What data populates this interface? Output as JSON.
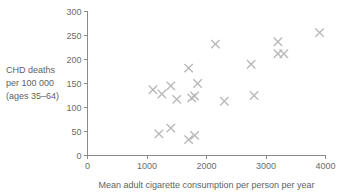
{
  "chart_data": {
    "type": "scatter",
    "title": "",
    "xlabel": "Mean adult cigarette consumption per person per year",
    "ylabel": "CHD deaths per 100 000 (ages 35–64)",
    "ylabel_lines": [
      "CHD deaths",
      "per 100 000",
      "(ages 35–64)"
    ],
    "xlim": [
      0,
      4000
    ],
    "ylim": [
      0,
      300
    ],
    "xticks": [
      0,
      1000,
      2000,
      3000,
      4000
    ],
    "yticks": [
      0,
      50,
      100,
      150,
      200,
      250,
      300
    ],
    "xticklabels": [
      "0",
      "1000",
      "2000",
      "3000",
      "4000"
    ],
    "yticklabels": [
      "0",
      "50",
      "100",
      "150",
      "200",
      "250",
      "300"
    ],
    "grid": false,
    "legend": false,
    "marker_style": "x",
    "marker_color": "#b9b9b9",
    "axis_color": "#8a8a8a",
    "text_color": "#5f5f5f",
    "points": [
      {
        "x": 1100,
        "y": 137
      },
      {
        "x": 1250,
        "y": 128
      },
      {
        "x": 1200,
        "y": 45
      },
      {
        "x": 1400,
        "y": 145
      },
      {
        "x": 1400,
        "y": 57
      },
      {
        "x": 1500,
        "y": 117
      },
      {
        "x": 1700,
        "y": 182
      },
      {
        "x": 1700,
        "y": 33
      },
      {
        "x": 1750,
        "y": 120
      },
      {
        "x": 1800,
        "y": 124
      },
      {
        "x": 1800,
        "y": 42
      },
      {
        "x": 1850,
        "y": 150
      },
      {
        "x": 2150,
        "y": 232
      },
      {
        "x": 2300,
        "y": 113
      },
      {
        "x": 2750,
        "y": 190
      },
      {
        "x": 2800,
        "y": 125
      },
      {
        "x": 3200,
        "y": 237
      },
      {
        "x": 3200,
        "y": 212
      },
      {
        "x": 3300,
        "y": 212
      },
      {
        "x": 3900,
        "y": 256
      }
    ]
  }
}
